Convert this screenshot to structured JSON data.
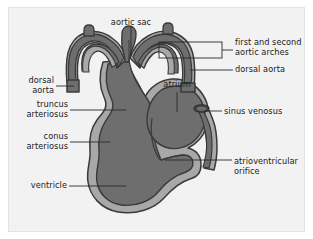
{
  "figure": {
    "type": "anatomical-diagram",
    "panel": {
      "background_color": "#f2f2f2",
      "border_color": "#e2e2e2"
    },
    "palette": {
      "lumen_dark": "#6e6e6e",
      "wall_light": "#a8a8a8",
      "outline": "#3a3a3a",
      "leader_line": "#2b2b2b",
      "text": "#1a1a1a",
      "page_background": "#ffffff"
    }
  },
  "labels": {
    "aortic_sac": "aortic sac",
    "first_and_second_aortic_arches_line1": "first and second",
    "first_and_second_aortic_arches_line2": "aortic arches",
    "dorsal_aorta_right": "dorsal aorta",
    "dorsal_aorta_left_line1": "dorsal",
    "dorsal_aorta_left_line2": "aorta",
    "truncus_arteriosus_line1": "truncus",
    "truncus_arteriosus_line2": "arteriosus",
    "conus_arteriosus_line1": "conus",
    "conus_arteriosus_line2": "arteriosus",
    "ventricle": "ventricle",
    "atrium": "atrium",
    "sinus_venosus": "sinus venosus",
    "atrioventricular_orifice_line1": "atrioventricular",
    "atrioventricular_orifice_line2": "orifice"
  }
}
